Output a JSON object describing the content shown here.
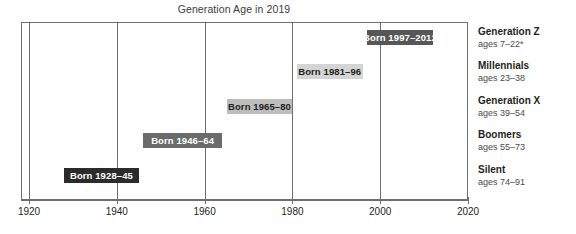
{
  "chart_data": {
    "type": "bar",
    "title": "Generation Age in 2019",
    "xlabel": "",
    "ylabel": "",
    "orientation": "horizontal",
    "xlim": [
      1920,
      2020
    ],
    "xticks": [
      "1920",
      "1940",
      "1960",
      "1980",
      "2000",
      "2020"
    ],
    "xtick_values": [
      1920,
      1940,
      1960,
      1980,
      2000,
      2020
    ],
    "grid": true,
    "legend_position": "right",
    "categories": [
      "Generation Z",
      "Millennials",
      "Generation X",
      "Boomers",
      "Silent"
    ],
    "series": [
      {
        "name": "Birth year span",
        "bars": [
          {
            "category": "Generation Z",
            "label": "Born 1997–2012",
            "start": 1997,
            "end": 2012,
            "ages": "ages 7–22*",
            "fill": "#575757",
            "text_color": "#ffffff"
          },
          {
            "category": "Millennials",
            "label": "Born 1981–96",
            "start": 1981,
            "end": 1996,
            "ages": "ages 23–38",
            "fill": "#d4d4d4",
            "text_color": "#231f20"
          },
          {
            "category": "Generation X",
            "label": "Born 1965–80",
            "start": 1965,
            "end": 1980,
            "ages": "ages 39–54",
            "fill": "#bdbdbd",
            "text_color": "#231f20"
          },
          {
            "category": "Boomers",
            "label": "Born 1946–64",
            "start": 1946,
            "end": 1964,
            "ages": "ages 55–73",
            "fill": "#6b6b6b",
            "text_color": "#ffffff"
          },
          {
            "category": "Silent",
            "label": "Born 1928–45",
            "start": 1928,
            "end": 1945,
            "ages": "ages 74–91",
            "fill": "#2b2b2b",
            "text_color": "#ffffff"
          }
        ]
      }
    ]
  },
  "legend": {
    "entries": [
      {
        "name": "Generation Z",
        "ages": "ages 7–22*"
      },
      {
        "name": "Millennials",
        "ages": "ages 23–38"
      },
      {
        "name": "Generation X",
        "ages": "ages 39–54"
      },
      {
        "name": "Boomers",
        "ages": "ages 55–73"
      },
      {
        "name": "Silent",
        "ages": "ages 74–91"
      }
    ]
  },
  "colors": {
    "frame": "#6e6e6e",
    "background": "#ffffff",
    "title_text": "#3b3b3b",
    "axis_text": "#231f20"
  }
}
